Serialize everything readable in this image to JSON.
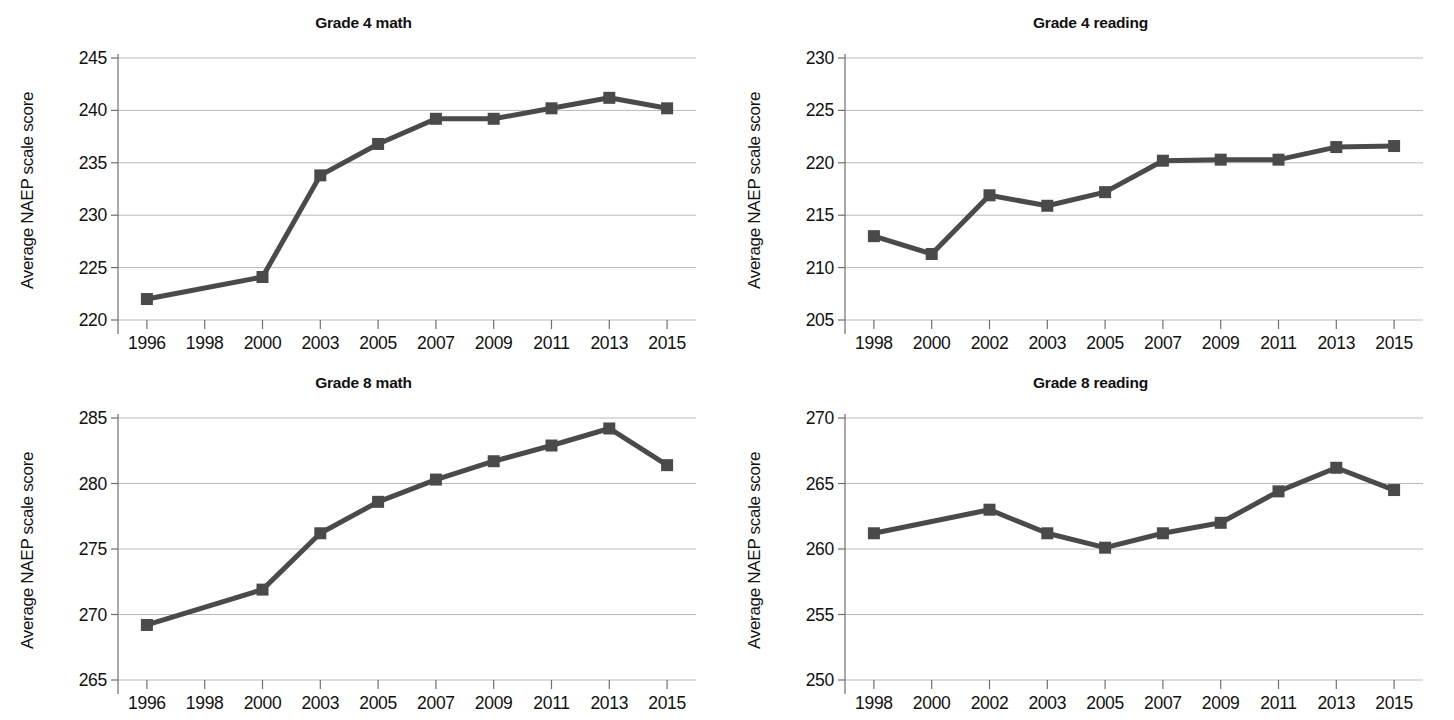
{
  "figure": {
    "background_color": "#ffffff",
    "series_color": "#4a4a4a",
    "gridline_color": "#b9b9b9",
    "axis_color": "#6f6f6f",
    "text_color": "#111111",
    "ylabel": "Average NAEP scale score"
  },
  "chart_data": [
    {
      "type": "line",
      "title": "Grade 4 math",
      "xlabel": "",
      "ylabel": "Average NAEP scale score",
      "grid": true,
      "legend": "none",
      "marker": "square",
      "categories": [
        "1996",
        "1998",
        "2000",
        "2003",
        "2005",
        "2007",
        "2009",
        "2011",
        "2013",
        "2015"
      ],
      "x_tick_labels": [
        "1996",
        "1998",
        "2000",
        "2003",
        "2005",
        "2007",
        "2009",
        "2011",
        "2013",
        "2015"
      ],
      "y_tick_labels": [
        "245",
        "240",
        "235",
        "230",
        "225",
        "220"
      ],
      "ylim": [
        220,
        245
      ],
      "yticks": [
        220,
        225,
        230,
        235,
        240,
        245
      ],
      "series": [
        {
          "name": "Grade 4 math average NAEP scale score",
          "points": [
            {
              "x": "1996",
              "y": 222.0
            },
            {
              "x": "2000",
              "y": 224.1
            },
            {
              "x": "2003",
              "y": 233.8
            },
            {
              "x": "2005",
              "y": 236.8
            },
            {
              "x": "2007",
              "y": 239.2
            },
            {
              "x": "2009",
              "y": 239.2
            },
            {
              "x": "2011",
              "y": 240.2
            },
            {
              "x": "2013",
              "y": 241.2
            },
            {
              "x": "2015",
              "y": 240.2
            }
          ]
        }
      ]
    },
    {
      "type": "line",
      "title": "Grade 4 reading",
      "xlabel": "",
      "ylabel": "Average NAEP scale score",
      "grid": true,
      "legend": "none",
      "marker": "square",
      "categories": [
        "1998",
        "2000",
        "2002",
        "2003",
        "2005",
        "2007",
        "2009",
        "2011",
        "2013",
        "2015"
      ],
      "x_tick_labels": [
        "1998",
        "2000",
        "2002",
        "2003",
        "2005",
        "2007",
        "2009",
        "2011",
        "2013",
        "2015"
      ],
      "y_tick_labels": [
        "230",
        "225",
        "220",
        "215",
        "210",
        "205"
      ],
      "ylim": [
        205,
        230
      ],
      "yticks": [
        205,
        210,
        215,
        220,
        225,
        230
      ],
      "series": [
        {
          "name": "Grade 4 reading average NAEP scale score",
          "points": [
            {
              "x": "1998",
              "y": 213.0
            },
            {
              "x": "2000",
              "y": 211.3
            },
            {
              "x": "2002",
              "y": 216.9
            },
            {
              "x": "2003",
              "y": 215.9
            },
            {
              "x": "2005",
              "y": 217.2
            },
            {
              "x": "2007",
              "y": 220.2
            },
            {
              "x": "2009",
              "y": 220.3
            },
            {
              "x": "2011",
              "y": 220.3
            },
            {
              "x": "2013",
              "y": 221.5
            },
            {
              "x": "2015",
              "y": 221.6
            }
          ]
        }
      ]
    },
    {
      "type": "line",
      "title": "Grade 8 math",
      "xlabel": "",
      "ylabel": "Average NAEP scale score",
      "grid": true,
      "legend": "none",
      "marker": "square",
      "categories": [
        "1996",
        "1998",
        "2000",
        "2003",
        "2005",
        "2007",
        "2009",
        "2011",
        "2013",
        "2015"
      ],
      "x_tick_labels": [
        "1996",
        "1998",
        "2000",
        "2003",
        "2005",
        "2007",
        "2009",
        "2011",
        "2013",
        "2015"
      ],
      "y_tick_labels": [
        "285",
        "280",
        "275",
        "270",
        "265"
      ],
      "ylim": [
        265,
        285
      ],
      "yticks": [
        265,
        270,
        275,
        280,
        285
      ],
      "series": [
        {
          "name": "Grade 8 math average NAEP scale score",
          "points": [
            {
              "x": "1996",
              "y": 269.2
            },
            {
              "x": "2000",
              "y": 271.9
            },
            {
              "x": "2003",
              "y": 276.2
            },
            {
              "x": "2005",
              "y": 278.6
            },
            {
              "x": "2007",
              "y": 280.3
            },
            {
              "x": "2009",
              "y": 281.7
            },
            {
              "x": "2011",
              "y": 282.9
            },
            {
              "x": "2013",
              "y": 284.2
            },
            {
              "x": "2015",
              "y": 281.4
            }
          ]
        }
      ]
    },
    {
      "type": "line",
      "title": "Grade 8 reading",
      "xlabel": "",
      "ylabel": "Average NAEP scale score",
      "grid": true,
      "legend": "none",
      "marker": "square",
      "categories": [
        "1998",
        "2000",
        "2002",
        "2003",
        "2005",
        "2007",
        "2009",
        "2011",
        "2013",
        "2015"
      ],
      "x_tick_labels": [
        "1998",
        "2000",
        "2002",
        "2003",
        "2005",
        "2007",
        "2009",
        "2011",
        "2013",
        "2015"
      ],
      "y_tick_labels": [
        "270",
        "265",
        "260",
        "255",
        "250"
      ],
      "ylim": [
        250,
        270
      ],
      "yticks": [
        250,
        255,
        260,
        265,
        270
      ],
      "series": [
        {
          "name": "Grade 8 reading average NAEP scale score",
          "points": [
            {
              "x": "1998",
              "y": 261.2
            },
            {
              "x": "2002",
              "y": 263.0
            },
            {
              "x": "2003",
              "y": 261.2
            },
            {
              "x": "2005",
              "y": 260.1
            },
            {
              "x": "2007",
              "y": 261.2
            },
            {
              "x": "2009",
              "y": 262.0
            },
            {
              "x": "2011",
              "y": 264.4
            },
            {
              "x": "2013",
              "y": 266.2
            },
            {
              "x": "2015",
              "y": 264.5
            }
          ]
        }
      ]
    }
  ],
  "panel_layout": [
    {
      "index": 0,
      "plot": {
        "left": 118,
        "top": 58,
        "width": 578,
        "height": 262
      },
      "title_top": 14,
      "ylabel_left": 18,
      "ylabel_center": 190
    },
    {
      "index": 1,
      "plot": {
        "left": 118,
        "top": 58,
        "width": 578,
        "height": 262
      },
      "title_top": 14,
      "ylabel_left": 18,
      "ylabel_center": 190
    },
    {
      "index": 2,
      "plot": {
        "left": 118,
        "top": 58,
        "width": 578,
        "height": 262
      },
      "title_top": 14,
      "ylabel_left": 18,
      "ylabel_center": 190
    },
    {
      "index": 3,
      "plot": {
        "left": 118,
        "top": 58,
        "width": 578,
        "height": 262
      },
      "title_top": 14,
      "ylabel_left": 18,
      "ylabel_center": 190
    }
  ]
}
